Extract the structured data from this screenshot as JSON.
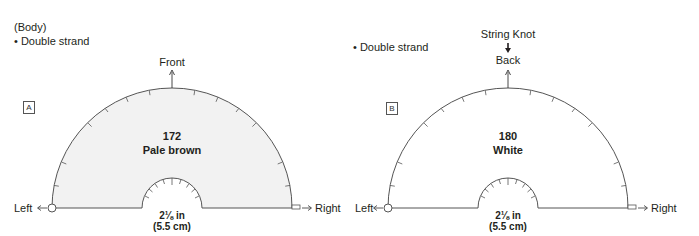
{
  "panel_a": {
    "heading": "(Body)",
    "note": "• Double strand",
    "top_label": "Front",
    "box_label": "A",
    "color_number": "172",
    "color_name": "Pale brown",
    "center_size_in": "2⅛ in",
    "center_size_cm": "(5.5 cm)",
    "left_label": "Left",
    "right_label": "Right",
    "fill_color": "#f2f2f2"
  },
  "panel_b": {
    "note": "• Double strand",
    "top_label_1": "String Knot",
    "top_label_2": "Back",
    "box_label": "B",
    "color_number": "180",
    "color_name": "White",
    "center_size_in": "2⅛ in",
    "center_size_cm": "(5.5 cm)",
    "left_label": "Left",
    "right_label": "Right",
    "fill_color": "#ffffff"
  },
  "colors": {
    "line": "#555555",
    "text": "#231f20"
  }
}
